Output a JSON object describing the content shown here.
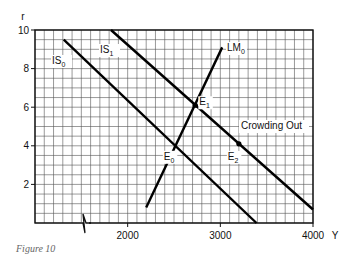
{
  "chart_data": {
    "type": "line",
    "title": "",
    "xlabel": "Y",
    "ylabel": "r",
    "xlim": [
      1000,
      4000
    ],
    "ylim": [
      0,
      10
    ],
    "x_ticks": [
      2000,
      3000,
      4000
    ],
    "x_tick_labels": [
      "2000",
      "3000",
      "4000"
    ],
    "y_ticks": [
      2,
      4,
      6,
      8,
      10
    ],
    "y_tick_labels": [
      "2",
      "4",
      "6",
      "8",
      "10"
    ],
    "grid": true,
    "grid_step_x": 100,
    "grid_step_y": 0.5,
    "axis_break_x": true,
    "series": [
      {
        "name": "IS0",
        "label_main": "IS",
        "label_sub": "0",
        "x": [
          1310,
          3390
        ],
        "y": [
          9.5,
          0.0
        ]
      },
      {
        "name": "IS1",
        "label_main": "IS",
        "label_sub": "1",
        "x": [
          1820,
          4000
        ],
        "y": [
          10.0,
          0.7
        ]
      },
      {
        "name": "LM0",
        "label_main": "LM",
        "label_sub": "0",
        "x": [
          2200,
          3020
        ],
        "y": [
          0.8,
          9.1
        ]
      }
    ],
    "points": [
      {
        "name": "E0",
        "label_main": "E",
        "label_sub": "0",
        "x": 2530,
        "y": 4.0,
        "marker": false
      },
      {
        "name": "E1",
        "label_main": "E",
        "label_sub": "1",
        "x": 2730,
        "y": 6.1,
        "marker": true
      },
      {
        "name": "E2",
        "label_main": "E",
        "label_sub": "2",
        "x": 3200,
        "y": 4.1,
        "marker": true
      }
    ],
    "annotations": [
      {
        "text": "Crowding Out",
        "x": 3400,
        "y": 4.9
      }
    ]
  },
  "caption": "Figure 10"
}
